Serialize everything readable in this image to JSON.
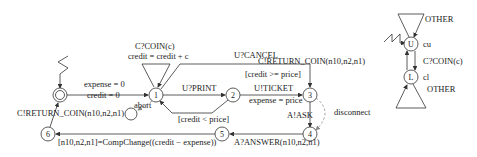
{
  "diagram": {
    "type": "state-machine",
    "main_machine": {
      "states": [
        {
          "id": "init",
          "label": ""
        },
        {
          "id": "1",
          "label": "1"
        },
        {
          "id": "2",
          "label": "2"
        },
        {
          "id": "3",
          "label": "3"
        },
        {
          "id": "4",
          "label": "4"
        },
        {
          "id": "5",
          "label": "5"
        },
        {
          "id": "6",
          "label": "6"
        },
        {
          "id": "abort",
          "label": ""
        }
      ],
      "transitions": {
        "init_to_1": {
          "line1": "expense = 0",
          "line2": "credit = 0"
        },
        "self_1": {
          "line1": "C?COIN(c)",
          "line2": "credit = credit + c"
        },
        "1_to_3_cancel": {
          "label": "U?CANCEL"
        },
        "1_to_2": {
          "label": "U?PRINT"
        },
        "2_to_3": {
          "guard": "[credit >= price]",
          "line1": "U!TICKET",
          "line2": "expense = price"
        },
        "2_to_1": {
          "guard": "[credit < price]"
        },
        "1_to_abort": {
          "label": "abort"
        },
        "3_to_4": {
          "label": "A!ASK"
        },
        "3_to_4_disconnect": {
          "label": "disconnect"
        },
        "4_to_5": {
          "label": "A?ANSWER(n10,n2,n1)"
        },
        "5_to_6": {
          "label": "[n10,n2,n1]=CompChange((credit − expense))"
        },
        "6_to_init": {
          "label": "C!RETURN_COIN(n10,n2,n1)"
        }
      }
    },
    "side_machine": {
      "states": [
        {
          "id": "U",
          "label": "U",
          "annotation": "cu"
        },
        {
          "id": "L",
          "label": "L",
          "annotation": "cl"
        }
      ],
      "transitions": {
        "self_U": {
          "label": "OTHER"
        },
        "self_L": {
          "label": "OTHER"
        },
        "U_to_L": {
          "label": "C?COIN(c)"
        },
        "L_to_U": {
          "label": "C!RETURN_COIN(n10,n2,n1)"
        }
      }
    }
  }
}
